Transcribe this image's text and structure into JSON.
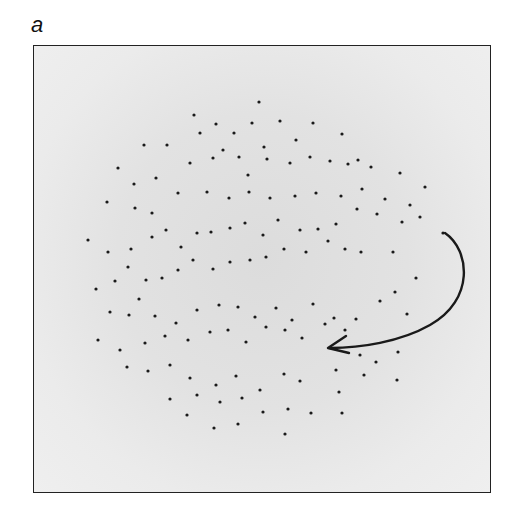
{
  "figure": {
    "panel_label": "a",
    "frame": {
      "x": 33,
      "y": 45,
      "width": 458,
      "height": 448
    },
    "colors": {
      "dot": "#1a1a1a",
      "arrow": "#1a1a1a",
      "frame_border": "#222222",
      "background_center": "#dcdcdc",
      "background_edge": "#efefef"
    },
    "dots": [
      [
        259,
        102
      ],
      [
        194,
        115
      ],
      [
        216,
        124
      ],
      [
        234,
        133
      ],
      [
        252,
        123
      ],
      [
        280,
        121
      ],
      [
        313,
        123
      ],
      [
        144,
        145
      ],
      [
        167,
        145
      ],
      [
        200,
        133
      ],
      [
        223,
        150
      ],
      [
        264,
        147
      ],
      [
        296,
        140
      ],
      [
        342,
        134
      ],
      [
        358,
        160
      ],
      [
        118,
        168
      ],
      [
        134,
        184
      ],
      [
        156,
        178
      ],
      [
        190,
        163
      ],
      [
        213,
        158
      ],
      [
        239,
        157
      ],
      [
        248,
        175
      ],
      [
        267,
        159
      ],
      [
        290,
        163
      ],
      [
        310,
        157
      ],
      [
        330,
        161
      ],
      [
        348,
        164
      ],
      [
        371,
        167
      ],
      [
        400,
        173
      ],
      [
        425,
        187
      ],
      [
        107,
        202
      ],
      [
        135,
        208
      ],
      [
        152,
        213
      ],
      [
        178,
        193
      ],
      [
        207,
        192
      ],
      [
        229,
        198
      ],
      [
        249,
        192
      ],
      [
        270,
        198
      ],
      [
        295,
        196
      ],
      [
        316,
        193
      ],
      [
        341,
        196
      ],
      [
        362,
        189
      ],
      [
        385,
        199
      ],
      [
        410,
        205
      ],
      [
        420,
        217
      ],
      [
        88,
        240
      ],
      [
        108,
        252
      ],
      [
        131,
        249
      ],
      [
        152,
        237
      ],
      [
        166,
        230
      ],
      [
        181,
        247
      ],
      [
        197,
        233
      ],
      [
        211,
        232
      ],
      [
        230,
        228
      ],
      [
        245,
        223
      ],
      [
        263,
        235
      ],
      [
        278,
        220
      ],
      [
        300,
        230
      ],
      [
        318,
        229
      ],
      [
        336,
        224
      ],
      [
        357,
        209
      ],
      [
        377,
        214
      ],
      [
        402,
        222
      ],
      [
        443,
        233
      ],
      [
        96,
        289
      ],
      [
        115,
        281
      ],
      [
        128,
        267
      ],
      [
        139,
        299
      ],
      [
        146,
        280
      ],
      [
        162,
        278
      ],
      [
        178,
        270
      ],
      [
        193,
        260
      ],
      [
        213,
        269
      ],
      [
        230,
        262
      ],
      [
        250,
        260
      ],
      [
        266,
        257
      ],
      [
        284,
        249
      ],
      [
        306,
        252
      ],
      [
        328,
        241
      ],
      [
        345,
        249
      ],
      [
        361,
        252
      ],
      [
        393,
        252
      ],
      [
        416,
        278
      ],
      [
        110,
        312
      ],
      [
        129,
        315
      ],
      [
        155,
        316
      ],
      [
        176,
        323
      ],
      [
        197,
        310
      ],
      [
        219,
        305
      ],
      [
        238,
        307
      ],
      [
        255,
        317
      ],
      [
        276,
        308
      ],
      [
        292,
        320
      ],
      [
        313,
        304
      ],
      [
        334,
        318
      ],
      [
        356,
        319
      ],
      [
        380,
        301
      ],
      [
        395,
        292
      ],
      [
        407,
        314
      ],
      [
        98,
        340
      ],
      [
        120,
        350
      ],
      [
        145,
        343
      ],
      [
        165,
        336
      ],
      [
        188,
        340
      ],
      [
        210,
        332
      ],
      [
        228,
        330
      ],
      [
        246,
        342
      ],
      [
        266,
        327
      ],
      [
        285,
        330
      ],
      [
        302,
        338
      ],
      [
        325,
        324
      ],
      [
        345,
        330
      ],
      [
        360,
        355
      ],
      [
        376,
        362
      ],
      [
        398,
        352
      ],
      [
        127,
        367
      ],
      [
        148,
        371
      ],
      [
        170,
        365
      ],
      [
        190,
        378
      ],
      [
        216,
        385
      ],
      [
        236,
        376
      ],
      [
        260,
        390
      ],
      [
        284,
        374
      ],
      [
        300,
        381
      ],
      [
        336,
        370
      ],
      [
        364,
        375
      ],
      [
        397,
        380
      ],
      [
        170,
        399
      ],
      [
        197,
        395
      ],
      [
        220,
        402
      ],
      [
        242,
        398
      ],
      [
        263,
        412
      ],
      [
        288,
        409
      ],
      [
        311,
        413
      ],
      [
        339,
        392
      ],
      [
        187,
        415
      ],
      [
        214,
        428
      ],
      [
        238,
        424
      ],
      [
        285,
        434
      ],
      [
        342,
        413
      ]
    ],
    "arrow": {
      "path": "M 445 233 C 470 250, 475 300, 430 325 C 400 342, 360 348, 330 348",
      "head_tip": [
        328,
        348
      ],
      "head_upper": [
        346,
        336
      ],
      "head_lower": [
        349,
        353
      ]
    }
  }
}
